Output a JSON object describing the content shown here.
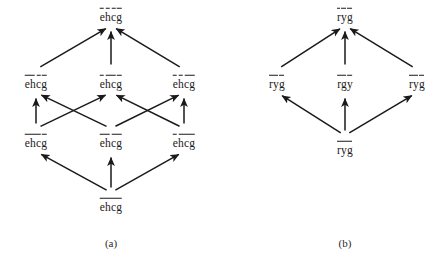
{
  "figure": {
    "background_color": "#ffffff",
    "ink_color": "#1a1a1a",
    "panels": [
      {
        "id": "panel-a",
        "caption": "(a)",
        "caption_pos": {
          "x": 111,
          "y": 243
        },
        "nodes": [
          {
            "id": "a-top",
            "label": "ehcg",
            "x": 111,
            "y": 14,
            "bar_spans": [
              [
                0,
                1
              ],
              [
                1,
                2
              ],
              [
                2,
                3
              ],
              [
                3,
                4
              ]
            ]
          },
          {
            "id": "a-m1",
            "label": "ehcg",
            "x": 36,
            "y": 81,
            "bar_spans": [
              [
                0,
                2
              ],
              [
                2,
                3
              ],
              [
                3,
                4
              ]
            ]
          },
          {
            "id": "a-m2",
            "label": "ehcg",
            "x": 111,
            "y": 81,
            "bar_spans": [
              [
                0,
                1
              ],
              [
                1,
                3
              ],
              [
                3,
                4
              ]
            ]
          },
          {
            "id": "a-m3",
            "label": "ehcg",
            "x": 184,
            "y": 81,
            "bar_spans": [
              [
                0,
                1
              ],
              [
                1,
                2
              ],
              [
                2,
                4
              ]
            ]
          },
          {
            "id": "a-b1",
            "label": "ehcg",
            "x": 36,
            "y": 140,
            "bar_spans": [
              [
                0,
                3
              ],
              [
                3,
                4
              ]
            ]
          },
          {
            "id": "a-b2",
            "label": "ehcg",
            "x": 111,
            "y": 140,
            "bar_spans": [
              [
                0,
                2
              ],
              [
                2,
                4
              ]
            ]
          },
          {
            "id": "a-b3",
            "label": "ehcg",
            "x": 184,
            "y": 140,
            "bar_spans": [
              [
                0,
                1
              ],
              [
                1,
                4
              ]
            ]
          },
          {
            "id": "a-bot",
            "label": "ehcg",
            "x": 111,
            "y": 204,
            "bar_spans": [
              [
                0,
                4
              ]
            ]
          }
        ],
        "edges": [
          {
            "from": "a-m1",
            "to": "a-top"
          },
          {
            "from": "a-m2",
            "to": "a-top"
          },
          {
            "from": "a-m3",
            "to": "a-top"
          },
          {
            "from": "a-b1",
            "to": "a-m1"
          },
          {
            "from": "a-b1",
            "to": "a-m2"
          },
          {
            "from": "a-b2",
            "to": "a-m1"
          },
          {
            "from": "a-b2",
            "to": "a-m3"
          },
          {
            "from": "a-b3",
            "to": "a-m2"
          },
          {
            "from": "a-b3",
            "to": "a-m3"
          },
          {
            "from": "a-bot",
            "to": "a-b1"
          },
          {
            "from": "a-bot",
            "to": "a-b2"
          },
          {
            "from": "a-bot",
            "to": "a-b3"
          }
        ]
      },
      {
        "id": "panel-b",
        "caption": "(b)",
        "caption_pos": {
          "x": 345,
          "y": 243
        },
        "nodes": [
          {
            "id": "b-top",
            "label": "ryg",
            "x": 345,
            "y": 14,
            "bar_spans": [
              [
                0,
                1
              ],
              [
                1,
                2
              ],
              [
                2,
                3
              ]
            ]
          },
          {
            "id": "b-m1",
            "label": "ryg",
            "x": 277,
            "y": 81,
            "bar_spans": [
              [
                0,
                2
              ],
              [
                2,
                3
              ]
            ]
          },
          {
            "id": "b-m2",
            "label": "rgy",
            "x": 345,
            "y": 81,
            "bar_spans": [
              [
                0,
                2
              ],
              [
                2,
                3
              ]
            ]
          },
          {
            "id": "b-m3",
            "label": "ryg",
            "x": 417,
            "y": 81,
            "bar_spans": [
              [
                0,
                2
              ],
              [
                2,
                3
              ]
            ]
          },
          {
            "id": "b-bot",
            "label": "ryg",
            "x": 345,
            "y": 147,
            "bar_spans": [
              [
                0,
                3
              ]
            ]
          }
        ],
        "edges": [
          {
            "from": "b-m1",
            "to": "b-top"
          },
          {
            "from": "b-m2",
            "to": "b-top"
          },
          {
            "from": "b-m3",
            "to": "b-top"
          },
          {
            "from": "b-bot",
            "to": "b-m1"
          },
          {
            "from": "b-bot",
            "to": "b-m2"
          },
          {
            "from": "b-bot",
            "to": "b-m3"
          }
        ]
      }
    ]
  }
}
